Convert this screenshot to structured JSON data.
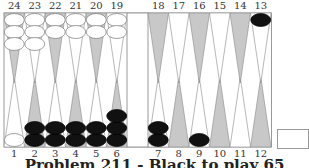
{
  "board": {
    "top_labels": [
      "24",
      "23",
      "22",
      "21",
      "20",
      "19",
      "18",
      "17",
      "16",
      "15",
      "14",
      "13"
    ],
    "bottom_labels": [
      "1",
      "2",
      "3",
      "4",
      "5",
      "6",
      "7",
      "8",
      "9",
      "10",
      "11",
      "12"
    ],
    "colors": {
      "light_point": "#ffffff",
      "dark_point": "#c8c8c8",
      "frame": "#999999",
      "white_checker": "#ffffff",
      "black_checker": "#111111"
    },
    "checkers": [
      {
        "point": 24,
        "color": "white",
        "count": 3
      },
      {
        "point": 23,
        "color": "white",
        "count": 3
      },
      {
        "point": 22,
        "color": "white",
        "count": 2
      },
      {
        "point": 21,
        "color": "white",
        "count": 2
      },
      {
        "point": 20,
        "color": "white",
        "count": 2
      },
      {
        "point": 19,
        "color": "white",
        "count": 2
      },
      {
        "point": 13,
        "color": "black",
        "count": 1
      },
      {
        "point": 1,
        "color": "white",
        "count": 1
      },
      {
        "point": 2,
        "color": "black",
        "count": 2
      },
      {
        "point": 3,
        "color": "black",
        "count": 2
      },
      {
        "point": 4,
        "color": "black",
        "count": 2
      },
      {
        "point": 5,
        "color": "black",
        "count": 2
      },
      {
        "point": 6,
        "color": "black",
        "count": 3
      },
      {
        "point": 7,
        "color": "black",
        "count": 2
      },
      {
        "point": 9,
        "color": "black",
        "count": 1
      }
    ]
  },
  "caption": "Problem 211 - Black to play 65"
}
